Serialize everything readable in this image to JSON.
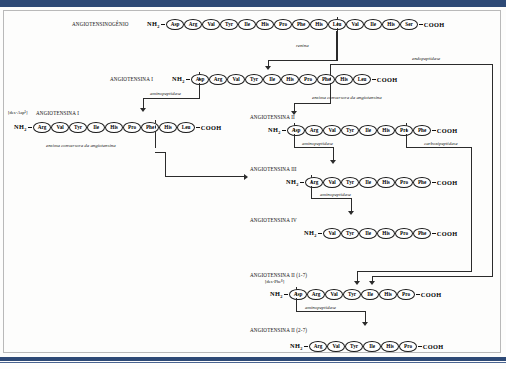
{
  "diagram": {
    "accent_color": "#2e4a76",
    "peptides": [
      {
        "id": "angiotensinogenio",
        "name": "ANGIOTENSINOGÊNIO",
        "subname": "",
        "n_terminus": "NH",
        "n_sub": "2",
        "c_terminus": "COOH",
        "residues": [
          "Asp",
          "Arg",
          "Val",
          "Tyr",
          "Ile",
          "His",
          "Pro",
          "Phe",
          "His",
          "Leu",
          "Val",
          "Ile",
          "His",
          "Ser"
        ]
      },
      {
        "id": "angiotensina-i",
        "name": "ANGIOTENSINA I",
        "subname": "",
        "n_terminus": "NH",
        "n_sub": "2",
        "c_terminus": "COOH",
        "residues": [
          "Asp",
          "Arg",
          "Val",
          "Tyr",
          "Ile",
          "His",
          "Pro",
          "Phe",
          "His",
          "Leu"
        ]
      },
      {
        "id": "des-asp-angiotensina-i",
        "name": "ANGIOTENSINA I",
        "subname": "[des-Asp¹]",
        "n_terminus": "NH",
        "n_sub": "2",
        "c_terminus": "COOH",
        "residues": [
          "Arg",
          "Val",
          "Tyr",
          "Ile",
          "His",
          "Pro",
          "Phe",
          "His",
          "Leu"
        ]
      },
      {
        "id": "angiotensina-ii",
        "name": "ANGIOTENSINA II",
        "subname": "",
        "n_terminus": "NH",
        "n_sub": "2",
        "c_terminus": "COOH",
        "residues": [
          "Asp",
          "Arg",
          "Val",
          "Tyr",
          "Ile",
          "His",
          "Pro",
          "Phe"
        ]
      },
      {
        "id": "angiotensina-iii",
        "name": "ANGIOTENSINA III",
        "subname": "",
        "n_terminus": "NH",
        "n_sub": "2",
        "c_terminus": "COOH",
        "residues": [
          "Arg",
          "Val",
          "Tyr",
          "Ile",
          "His",
          "Pro",
          "Phe"
        ]
      },
      {
        "id": "angiotensina-iv",
        "name": "ANGIOTENSINA IV",
        "subname": "",
        "n_terminus": "NH",
        "n_sub": "2",
        "c_terminus": "COOH",
        "residues": [
          "Val",
          "Tyr",
          "Ile",
          "His",
          "Pro",
          "Phe"
        ]
      },
      {
        "id": "angiotensina-ii-1-7",
        "name": "ANGIOTENSINA II (1-7)",
        "subname": "[des-Phe⁸]",
        "n_terminus": "NH",
        "n_sub": "2",
        "c_terminus": "COOH",
        "residues": [
          "Asp",
          "Arg",
          "Val",
          "Tyr",
          "Ile",
          "His",
          "Pro"
        ]
      },
      {
        "id": "angiotensina-ii-2-7",
        "name": "ANGIOTENSINA II (2-7)",
        "subname": "",
        "n_terminus": "NH",
        "n_sub": "2",
        "c_terminus": "COOH",
        "residues": [
          "Arg",
          "Val",
          "Tyr",
          "Ile",
          "His",
          "Pro"
        ]
      }
    ],
    "enzymes": {
      "renina": "renina",
      "endopeptidase": "endopeptidase",
      "aminopeptidase_1": "aminopeptidase",
      "eca_left": "enzima conversora da angiotensina",
      "eca_right": "enzima conversora da angiotensina",
      "aminopeptidase_2": "aminopeptidase",
      "carboxipeptidase": "carboxipeptidase",
      "aminopeptidase_3": "aminopeptidase",
      "aminopeptidase_4": "aminopeptidase"
    }
  }
}
